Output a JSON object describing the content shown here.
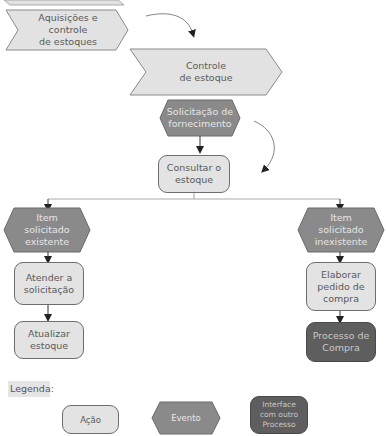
{
  "diagram": {
    "title_partial": "...",
    "nodes": {
      "aquisicoes": {
        "type": "process",
        "label": "Aquisições e controle\nde estoques"
      },
      "controle": {
        "type": "process",
        "label": "Controle\nde estoque"
      },
      "solicitacao": {
        "type": "event",
        "label": "Solicitação de\nfornecimento"
      },
      "consultar": {
        "type": "action",
        "label": "Consultar o\nestoque"
      },
      "existente": {
        "type": "event",
        "label": "Item\nsolicitado\nexistente"
      },
      "inexistente": {
        "type": "event",
        "label": "Item\nsolicitado\ninexistente"
      },
      "atender": {
        "type": "action",
        "label": "Atender a\nsolicitação"
      },
      "atualizar": {
        "type": "action",
        "label": "Atualizar\nestoque"
      },
      "elaborar": {
        "type": "action",
        "label": "Elaborar\npedido de\ncompra"
      },
      "processo_compra": {
        "type": "interface",
        "label": "Processo de\nCompra"
      }
    },
    "edges": [
      [
        "aquisicoes",
        "controle"
      ],
      [
        "controle",
        "solicitacao"
      ],
      [
        "solicitacao",
        "consultar"
      ],
      [
        "consultar",
        "existente"
      ],
      [
        "consultar",
        "inexistente"
      ],
      [
        "existente",
        "atender"
      ],
      [
        "atender",
        "atualizar"
      ],
      [
        "inexistente",
        "elaborar"
      ],
      [
        "elaborar",
        "processo_compra"
      ]
    ]
  },
  "legend": {
    "title": "Legenda:",
    "items": [
      {
        "shape": "action",
        "label": "Ação"
      },
      {
        "shape": "event",
        "label": "Evento"
      },
      {
        "shape": "interface",
        "label": "Interface\ncom outro\nProcesso"
      }
    ]
  },
  "colors": {
    "process_fill": "#e2e2e2",
    "action_fill": "#e3e3e3",
    "event_fill": "#8a8a8a",
    "interface_fill": "#5e5e5e",
    "stroke": "#6e6e6e"
  }
}
